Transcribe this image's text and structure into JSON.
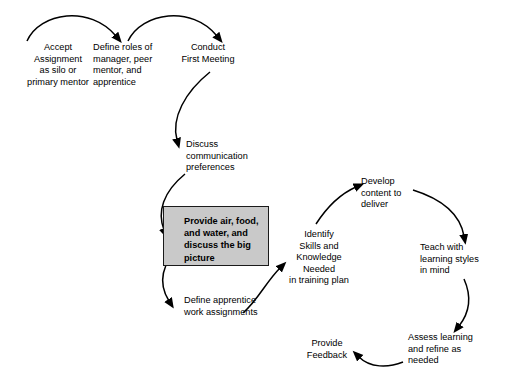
{
  "diagram": {
    "type": "flowchart",
    "background_color": "#ffffff",
    "line_color": "#000000",
    "highlight_fill_color": "#c9c9c9",
    "highlight_border_color": "#1a1a1a",
    "nodes": [
      {
        "id": "accept-assignment",
        "text": "Accept\nAssignment\nas silo or\nprimary mentor",
        "x": 8,
        "y": 42,
        "width": 100,
        "align": "center",
        "highlighted": false
      },
      {
        "id": "define-roles",
        "text": "Define roles of\nmanager, peer\nmentor, and\napprentice",
        "x": 93,
        "y": 42,
        "width": 82,
        "align": "left",
        "highlighted": false
      },
      {
        "id": "conduct-first-meeting",
        "text": "Conduct\nFirst Meeting",
        "x": 168,
        "y": 42,
        "width": 80,
        "align": "center",
        "highlighted": false
      },
      {
        "id": "discuss-communication",
        "text": "Discuss\ncommunication\npreferences",
        "x": 186,
        "y": 139,
        "width": 80,
        "align": "left",
        "highlighted": false
      },
      {
        "id": "provide-air-food-water",
        "text": "Provide air, food,\nand water, and\ndiscuss the big\npicture",
        "x": 184,
        "y": 215,
        "width": 84,
        "align": "left",
        "highlighted": true
      },
      {
        "id": "define-apprentice-work",
        "text": "Define apprentice\nwork assignments",
        "x": 184,
        "y": 295,
        "width": 90,
        "align": "left",
        "highlighted": false
      },
      {
        "id": "identify-skills",
        "text": "Identify\nSkills and\nKnowledge\nNeeded\nin training plan",
        "x": 281,
        "y": 229,
        "width": 76,
        "align": "center",
        "highlighted": false
      },
      {
        "id": "develop-content",
        "text": "Develop\ncontent to\ndeliver",
        "x": 361,
        "y": 176,
        "width": 62,
        "align": "left",
        "highlighted": false
      },
      {
        "id": "teach-learning-styles",
        "text": "Teach with\nlearning styles\nin mind",
        "x": 420,
        "y": 242,
        "width": 76,
        "align": "left",
        "highlighted": false
      },
      {
        "id": "assess-learning",
        "text": "Assess learning\nand refine as\nneeded",
        "x": 408,
        "y": 332,
        "width": 84,
        "align": "left",
        "highlighted": false
      },
      {
        "id": "provide-feedback",
        "text": "Provide\nFeedback",
        "x": 296,
        "y": 338,
        "width": 62,
        "align": "center",
        "highlighted": false
      }
    ],
    "highlight_box": {
      "x": 163,
      "y": 206,
      "width": 106,
      "height": 60
    },
    "connectors": [
      {
        "id": "accept-to-define",
        "from": "accept-assignment",
        "to": "define-roles",
        "style": "arc"
      },
      {
        "id": "define-to-conduct",
        "from": "define-roles",
        "to": "conduct-first-meeting",
        "style": "arc"
      },
      {
        "id": "conduct-to-discuss",
        "from": "conduct-first-meeting",
        "to": "discuss-communication",
        "style": "arc"
      },
      {
        "id": "discuss-to-provide",
        "from": "discuss-communication",
        "to": "provide-air-food-water",
        "style": "arc"
      },
      {
        "id": "provide-to-define-work",
        "from": "provide-air-food-water",
        "to": "define-apprentice-work",
        "style": "arc"
      },
      {
        "id": "define-work-to-identify",
        "from": "define-apprentice-work",
        "to": "identify-skills",
        "style": "arc"
      },
      {
        "id": "identify-to-develop",
        "from": "identify-skills",
        "to": "develop-content",
        "style": "arc"
      },
      {
        "id": "develop-to-teach",
        "from": "develop-content",
        "to": "teach-learning-styles",
        "style": "arc"
      },
      {
        "id": "teach-to-assess",
        "from": "teach-learning-styles",
        "to": "assess-learning",
        "style": "arc"
      },
      {
        "id": "assess-to-feedback",
        "from": "assess-learning",
        "to": "provide-feedback",
        "style": "arc"
      }
    ]
  }
}
